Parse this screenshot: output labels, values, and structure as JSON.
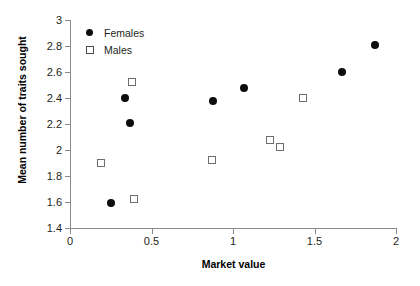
{
  "chart_data": {
    "type": "scatter",
    "title": "",
    "xlabel": "Market value",
    "ylabel": "Mean number of traits sought",
    "xlim": [
      0,
      2
    ],
    "ylim": [
      1.4,
      3
    ],
    "xticks": [
      0,
      0.5,
      1,
      1.5,
      2
    ],
    "xtick_labels": [
      "0",
      "0.5",
      "1",
      "1.5",
      "2"
    ],
    "yticks": [
      1.4,
      1.6,
      1.8,
      2,
      2.2,
      2.4,
      2.6,
      2.8,
      3
    ],
    "ytick_labels": [
      "1.4",
      "1.6",
      "1.8",
      "2",
      "2.2",
      "2.4",
      "2.6",
      "2.8",
      "3"
    ],
    "grid": false,
    "legend_position": "top-left",
    "series": [
      {
        "name": "Females",
        "marker": "filled-circle",
        "color": "#0d0d0d",
        "points": [
          {
            "x": 0.25,
            "y": 1.59
          },
          {
            "x": 0.34,
            "y": 2.4
          },
          {
            "x": 0.37,
            "y": 2.21
          },
          {
            "x": 0.88,
            "y": 2.38
          },
          {
            "x": 1.07,
            "y": 2.48
          },
          {
            "x": 1.67,
            "y": 2.6
          },
          {
            "x": 1.87,
            "y": 2.81
          }
        ]
      },
      {
        "name": "Males",
        "marker": "open-square",
        "color": "#6e6e6e",
        "points": [
          {
            "x": 0.19,
            "y": 1.9
          },
          {
            "x": 0.38,
            "y": 2.52
          },
          {
            "x": 0.39,
            "y": 1.62
          },
          {
            "x": 0.87,
            "y": 1.92
          },
          {
            "x": 1.23,
            "y": 2.08
          },
          {
            "x": 1.29,
            "y": 2.02
          },
          {
            "x": 1.43,
            "y": 2.4
          }
        ]
      }
    ]
  },
  "legend": {
    "items": [
      {
        "label": "Females",
        "marker": "filled-circle"
      },
      {
        "label": "Males",
        "marker": "open-square"
      }
    ]
  }
}
